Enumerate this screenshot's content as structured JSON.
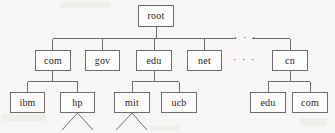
{
  "figure": {
    "background_color": "#f7f6f4",
    "box_fill_color": "#fdfdfc",
    "box_border_color": "#6d6d6d",
    "line_color": "#6d6d6d",
    "text_color": "#1d1d1d"
  },
  "nodes": {
    "root": {
      "label": "root",
      "x": 138,
      "y": 5,
      "w": 36,
      "h": 22
    },
    "com": {
      "label": "com",
      "x": 35,
      "y": 50,
      "w": 36,
      "h": 21
    },
    "gov": {
      "label": "gov",
      "x": 85,
      "y": 50,
      "w": 35,
      "h": 21
    },
    "edu": {
      "label": "edu",
      "x": 136,
      "y": 50,
      "w": 36,
      "h": 21
    },
    "net": {
      "label": "net",
      "x": 187,
      "y": 50,
      "w": 35,
      "h": 21
    },
    "cn": {
      "label": "cn",
      "x": 272,
      "y": 50,
      "w": 36,
      "h": 21
    },
    "ibm": {
      "label": "ibm",
      "x": 10,
      "y": 92,
      "w": 35,
      "h": 21
    },
    "hp": {
      "label": "hp",
      "x": 60,
      "y": 92,
      "w": 35,
      "h": 21
    },
    "mit": {
      "label": "mit",
      "x": 114,
      "y": 92,
      "w": 36,
      "h": 21
    },
    "ucb": {
      "label": "ucb",
      "x": 161,
      "y": 92,
      "w": 36,
      "h": 21
    },
    "cn_edu": {
      "label": "edu",
      "x": 250,
      "y": 92,
      "w": 36,
      "h": 21
    },
    "cn_com": {
      "label": "com",
      "x": 292,
      "y": 92,
      "w": 36,
      "h": 21
    }
  },
  "ellipses": {
    "top_line": {
      "label": "· · ·",
      "x": 234,
      "y": 33
    },
    "row_level": {
      "label": "· · ·",
      "x": 233,
      "y": 55
    }
  },
  "edges": {
    "root_to_bus": "vertical stem from root box down to level-1 bus",
    "level1_bus": "horizontal bus spanning com..cn with gap for ellipsis",
    "com_children": [
      "ibm",
      "hp"
    ],
    "edu_children": [
      "mit",
      "ucb"
    ],
    "cn_children": [
      "edu",
      "com"
    ],
    "leaf_fans": [
      "hp",
      "mit"
    ]
  }
}
